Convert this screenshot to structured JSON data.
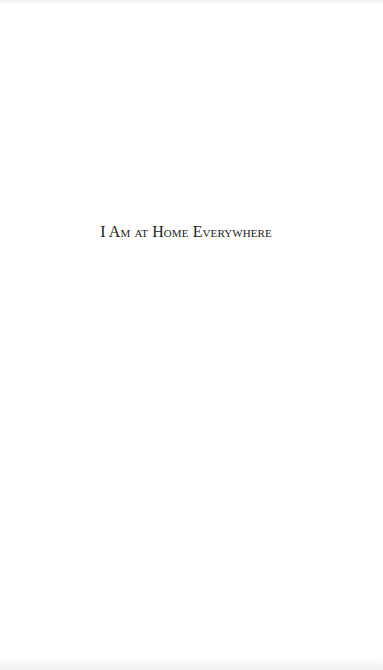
{
  "page": {
    "title": "I Am at Home Everywhere",
    "background_color": "#ffffff",
    "text_color": "#222222"
  }
}
